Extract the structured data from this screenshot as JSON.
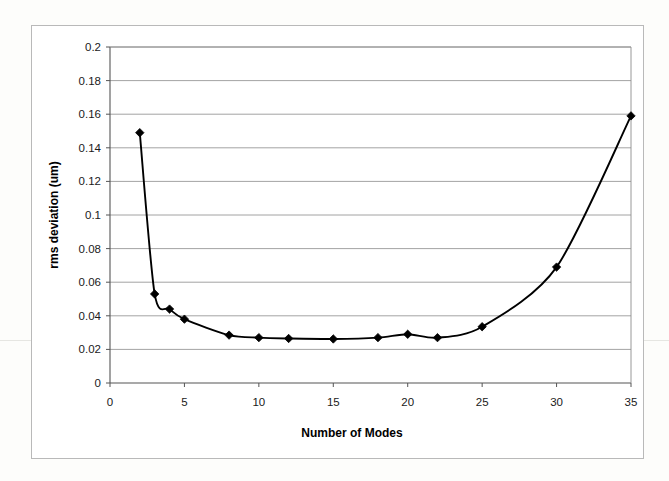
{
  "chart_data": {
    "type": "line",
    "title": "",
    "xlabel": "Number of Modes",
    "ylabel": "rms deviation (um)",
    "xlim": [
      0,
      35
    ],
    "ylim": [
      0,
      0.2
    ],
    "xticks": [
      0,
      5,
      10,
      15,
      20,
      25,
      30,
      35
    ],
    "xtick_labels": [
      "0",
      "5",
      "10",
      "15",
      "20",
      "25",
      "30",
      "35"
    ],
    "yticks": [
      0,
      0.02,
      0.04,
      0.06,
      0.08,
      0.1,
      0.12,
      0.14,
      0.16,
      0.18,
      0.2
    ],
    "ytick_labels": [
      "0",
      "0.02",
      "0.04",
      "0.06",
      "0.08",
      "0.1",
      "0.12",
      "0.14",
      "0.16",
      "0.18",
      "0.2"
    ],
    "grid": "horizontal",
    "legend": "none",
    "marker": "diamond",
    "line_color": "#000000",
    "marker_color": "#000000",
    "x": [
      2,
      3,
      4,
      5,
      8,
      10,
      12,
      15,
      18,
      20,
      22,
      25,
      30,
      35
    ],
    "values": [
      0.149,
      0.053,
      0.044,
      0.038,
      0.0285,
      0.027,
      0.0265,
      0.0262,
      0.027,
      0.029,
      0.027,
      0.0335,
      0.069,
      0.159
    ],
    "series": [
      {
        "name": "rms deviation",
        "points": [
          {
            "x": 2,
            "y": 0.149
          },
          {
            "x": 3,
            "y": 0.053
          },
          {
            "x": 4,
            "y": 0.044
          },
          {
            "x": 5,
            "y": 0.038
          },
          {
            "x": 8,
            "y": 0.0285
          },
          {
            "x": 10,
            "y": 0.027
          },
          {
            "x": 12,
            "y": 0.0265
          },
          {
            "x": 15,
            "y": 0.0262
          },
          {
            "x": 18,
            "y": 0.027
          },
          {
            "x": 20,
            "y": 0.029
          },
          {
            "x": 22,
            "y": 0.027
          },
          {
            "x": 25,
            "y": 0.0335
          },
          {
            "x": 30,
            "y": 0.069
          },
          {
            "x": 35,
            "y": 0.159
          }
        ]
      }
    ]
  },
  "axis": {
    "x_title": "Number of Modes",
    "y_title": "rms deviation (um)"
  }
}
